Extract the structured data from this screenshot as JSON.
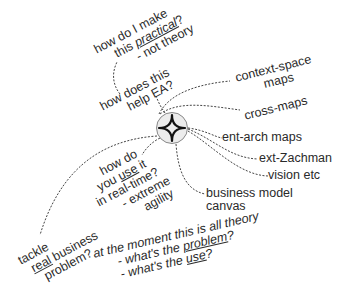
{
  "center": {
    "icon": "four-point-star-icon",
    "fill": "#ececec",
    "stroke": "#888888"
  },
  "link_color": "#444444",
  "nodes": {
    "practical": {
      "lines": [
        "how do I make",
        "this ",
        "practical",
        "?",
        "- not theory"
      ]
    },
    "help_ea": {
      "lines": [
        "how does this",
        "help EA?"
      ]
    },
    "context_space": {
      "lines": [
        "context-space",
        "maps"
      ]
    },
    "cross_maps": {
      "lines": [
        "cross-maps"
      ]
    },
    "ent_arch": {
      "lines": [
        "ent-arch maps"
      ]
    },
    "ext_zachman": {
      "lines": [
        "ext-Zachman"
      ]
    },
    "vision": {
      "lines": [
        "vision etc"
      ]
    },
    "bmc": {
      "lines": [
        "business model",
        "canvas"
      ]
    },
    "realtime": {
      "lines": [
        "how do",
        "you ",
        "use",
        " it",
        "in real-time?",
        "- extreme",
        "agility"
      ]
    },
    "tackle": {
      "lines": [
        "tackle",
        "real",
        " business",
        "problem?"
      ]
    },
    "theory": {
      "lines": [
        "at the moment this is all theory",
        "- what's the ",
        "problem",
        "?",
        "- what's the ",
        "use",
        "?"
      ]
    }
  }
}
